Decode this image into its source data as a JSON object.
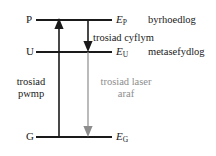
{
  "diagram": {
    "type": "energy-level-diagram",
    "colors": {
      "line": "#1a1a1a",
      "pump_arrow": "#1a1a1a",
      "fast_arrow": "#1a1a1a",
      "laser_arrow": "#8d8d8d",
      "background": "#ffffff"
    },
    "levels": [
      {
        "name": "P",
        "energy_symbol": "E",
        "energy_subscript": "P",
        "description": "byrhoedlog"
      },
      {
        "name": "U",
        "energy_symbol": "E",
        "energy_subscript": "U",
        "description": "metasefydlog"
      },
      {
        "name": "G",
        "energy_symbol": "E",
        "energy_subscript": "G",
        "description": ""
      }
    ],
    "transitions": [
      {
        "id": "pump",
        "label_line1": "trosiad",
        "label_line2": "pwmp",
        "direction": "up",
        "from": "G",
        "to": "P",
        "color": "#1a1a1a"
      },
      {
        "id": "fast",
        "label_line1": "trosiad cyflym",
        "label_line2": "",
        "direction": "down",
        "from": "P",
        "to": "U",
        "color": "#1a1a1a"
      },
      {
        "id": "laser",
        "label_line1": "trosiad laser",
        "label_line2": "araf",
        "direction": "down",
        "from": "U",
        "to": "G",
        "color": "#8d8d8d"
      }
    ]
  }
}
